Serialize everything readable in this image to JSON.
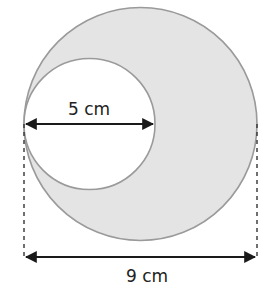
{
  "diagram": {
    "type": "geometry-circles",
    "outer_circle": {
      "diameter_label": "9 cm",
      "fill": "#e4e4e4",
      "stroke": "#9a9a9a"
    },
    "inner_circle": {
      "diameter_label": "5 cm",
      "fill": "#ffffff",
      "stroke": "#9a9a9a"
    },
    "arrow_color": "#1a1a1a",
    "dash_color": "#333333"
  }
}
